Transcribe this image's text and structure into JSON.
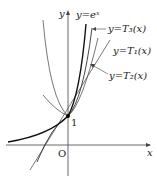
{
  "diagram": {
    "axes": {
      "x_label": "x",
      "y_label": "y",
      "origin_label": "O",
      "y_intercept_label": "1"
    },
    "curves": [
      {
        "id": "exp",
        "label": "y=eˣ"
      },
      {
        "id": "T3",
        "label": "y=T₃(x)"
      },
      {
        "id": "T1",
        "label": "y=T₁(x)"
      },
      {
        "id": "T2",
        "label": "y=T₂(x)"
      }
    ],
    "colors": {
      "curve": "#222222",
      "axis": "#333333"
    }
  }
}
